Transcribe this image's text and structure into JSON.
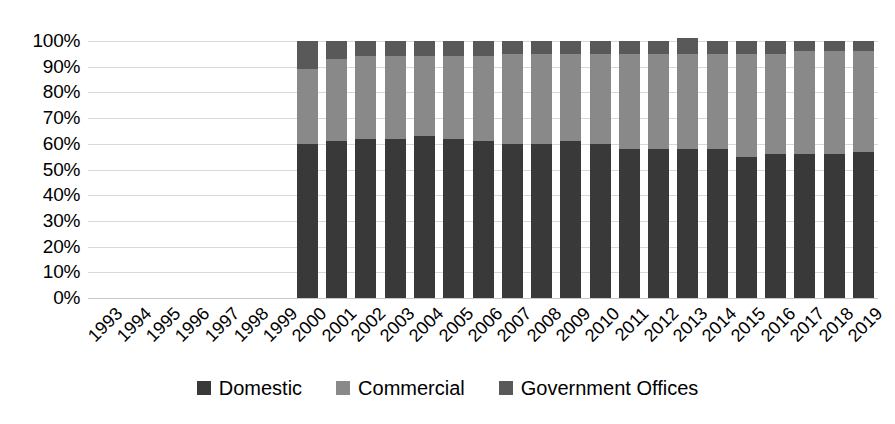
{
  "chart_data": {
    "type": "bar",
    "stacked": true,
    "title": "",
    "subtitle": "",
    "xlabel": "",
    "ylabel": "",
    "ylim": [
      0,
      100
    ],
    "ytick_labels": [
      "0%",
      "10%",
      "20%",
      "30%",
      "40%",
      "50%",
      "60%",
      "70%",
      "80%",
      "90%",
      "100%"
    ],
    "ytick_values": [
      0,
      10,
      20,
      30,
      40,
      50,
      60,
      70,
      80,
      90,
      100
    ],
    "grid": true,
    "legend_position": "bottom",
    "value_unit": "percent",
    "categories": [
      "1993",
      "1994",
      "1995",
      "1996",
      "1997",
      "1998",
      "1999",
      "2000",
      "2001",
      "2002",
      "2003",
      "2004",
      "2005",
      "2006",
      "2007",
      "2008",
      "2009",
      "2010",
      "2011",
      "2012",
      "2013",
      "2014",
      "2015",
      "2016",
      "2017",
      "2018",
      "2019"
    ],
    "series": [
      {
        "name": "Domestic",
        "color": "#393939",
        "values": [
          null,
          null,
          null,
          null,
          null,
          null,
          null,
          60,
          61,
          62,
          62,
          63,
          62,
          61,
          60,
          60,
          61,
          60,
          58,
          58,
          58,
          58,
          55,
          56,
          56,
          56,
          57
        ]
      },
      {
        "name": "Commercial",
        "color": "#898989",
        "values": [
          null,
          null,
          null,
          null,
          null,
          null,
          null,
          29,
          32,
          32,
          32,
          31,
          32,
          33,
          35,
          35,
          34,
          35,
          37,
          37,
          37,
          37,
          40,
          39,
          40,
          40,
          39
        ]
      },
      {
        "name": "Government Offices",
        "color": "#595959",
        "values": [
          null,
          null,
          null,
          null,
          null,
          null,
          null,
          11,
          7,
          6,
          6,
          6,
          6,
          6,
          5,
          5,
          5,
          5,
          5,
          5,
          6,
          5,
          5,
          5,
          4,
          4,
          4
        ]
      }
    ]
  },
  "legend": {
    "items": [
      {
        "label": "Domestic",
        "color": "#393939"
      },
      {
        "label": "Commercial",
        "color": "#898989"
      },
      {
        "label": "Government Offices",
        "color": "#595959"
      }
    ]
  }
}
